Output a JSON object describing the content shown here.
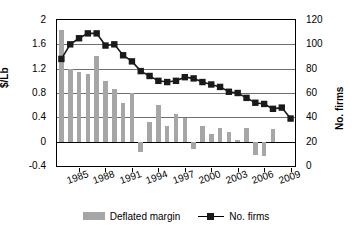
{
  "chart_data": {
    "type": "bar",
    "title": "",
    "xlabel": "",
    "ylabel": "$/Lb",
    "y2label": "No. firms",
    "ylim": [
      -0.4,
      2
    ],
    "y2lim": [
      0,
      120
    ],
    "yticks": [
      "2",
      "1.6",
      "1.2",
      "0.8",
      "0.4",
      "0",
      "-0.4"
    ],
    "ytick_values": [
      2,
      1.6,
      1.2,
      0.8,
      0.4,
      0,
      -0.4
    ],
    "y2ticks": [
      "120",
      "100",
      "80",
      "60",
      "40",
      "20",
      "0"
    ],
    "y2tick_values": [
      120,
      100,
      80,
      60,
      40,
      20,
      0
    ],
    "grid": true,
    "legend_position": "bottom",
    "categories": [
      "1983",
      "1984",
      "1985",
      "1986",
      "1987",
      "1988",
      "1989",
      "1990",
      "1991",
      "1992",
      "1993",
      "1994",
      "1995",
      "1996",
      "1997",
      "1998",
      "1999",
      "2000",
      "2001",
      "2002",
      "2003",
      "2004",
      "2005",
      "2006",
      "2007",
      "2008",
      "2009"
    ],
    "xtick_labels": [
      "1985",
      "1988",
      "1991",
      "1994",
      "1997",
      "2000",
      "2003",
      "2006",
      "2009"
    ],
    "series": [
      {
        "name": "Deflated margin",
        "type": "bar",
        "axis": "left",
        "color": "#a6a6a6",
        "values": [
          1.83,
          1.19,
          1.15,
          1.12,
          1.41,
          1.0,
          0.87,
          0.63,
          0.8,
          -0.17,
          0.32,
          0.6,
          0.26,
          0.46,
          0.39,
          -0.12,
          0.25,
          0.13,
          0.23,
          0.16,
          0.02,
          0.22,
          -0.22,
          -0.24,
          0.21,
          null,
          null
        ]
      },
      {
        "name": "No. firms",
        "type": "line",
        "axis": "right",
        "color": "#1a1a1a",
        "marker": "square",
        "values": [
          88,
          100,
          105,
          109,
          109,
          99,
          100,
          91,
          86,
          78,
          74,
          70,
          69,
          70,
          73,
          72,
          69,
          67,
          65,
          61,
          60,
          56,
          52,
          51,
          47,
          48,
          39
        ]
      }
    ]
  },
  "legend": {
    "items": [
      {
        "label": "Deflated margin",
        "marker": "bar-swatch"
      },
      {
        "label": "No. firms",
        "marker": "line-square"
      }
    ]
  }
}
